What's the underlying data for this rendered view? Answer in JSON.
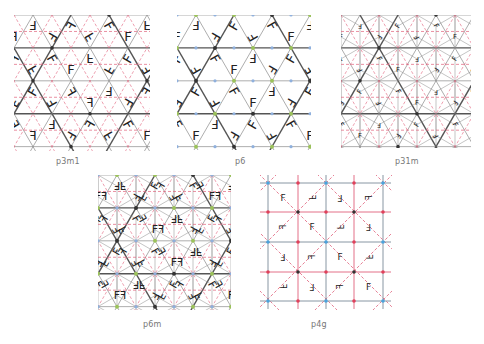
{
  "figure": {
    "panels": [
      {
        "id": "p3m1",
        "label": "p3m1",
        "type": "tri-mirror",
        "x": 14,
        "y": 15,
        "w": 136,
        "h": 136,
        "caption_x": 56,
        "caption_y": 165,
        "tri": 38
      },
      {
        "id": "p6",
        "label": "p6",
        "type": "tri-rot",
        "x": 177,
        "y": 15,
        "w": 134,
        "h": 135,
        "caption_x": 235,
        "caption_y": 165,
        "tri": 38
      },
      {
        "id": "p31m",
        "label": "p31m",
        "type": "tri-fine",
        "x": 341,
        "y": 15,
        "w": 130,
        "h": 133,
        "caption_x": 395,
        "caption_y": 165,
        "tri": 38
      },
      {
        "id": "p6m",
        "label": "p6m",
        "type": "tri-fine6",
        "x": 98,
        "y": 175,
        "w": 133,
        "h": 135,
        "caption_x": 143,
        "caption_y": 328,
        "tri": 38
      },
      {
        "id": "p4g",
        "label": "p4g",
        "type": "square",
        "x": 260,
        "y": 175,
        "w": 132,
        "h": 135,
        "caption_x": 311,
        "caption_y": 328,
        "grid_x": [
          268,
          298,
          326,
          354,
          383
        ],
        "grid_y": [
          183,
          212,
          242,
          272,
          301
        ]
      }
    ],
    "motif_glyph": "F",
    "colors": {
      "grid_line": "#8a8a8a",
      "bold_line": "#555555",
      "mirror_line": "#e0607a",
      "rot6_dot": "#333333",
      "rot3_dot": "#9bc25a",
      "rot2_dot": "#8fb0dd",
      "p4g_grid": "#7a8a99",
      "p4g_node_blue": "#4aa3dd",
      "p4g_node_red": "#e0405a",
      "caption": "#777777",
      "motif": "#222222"
    }
  }
}
